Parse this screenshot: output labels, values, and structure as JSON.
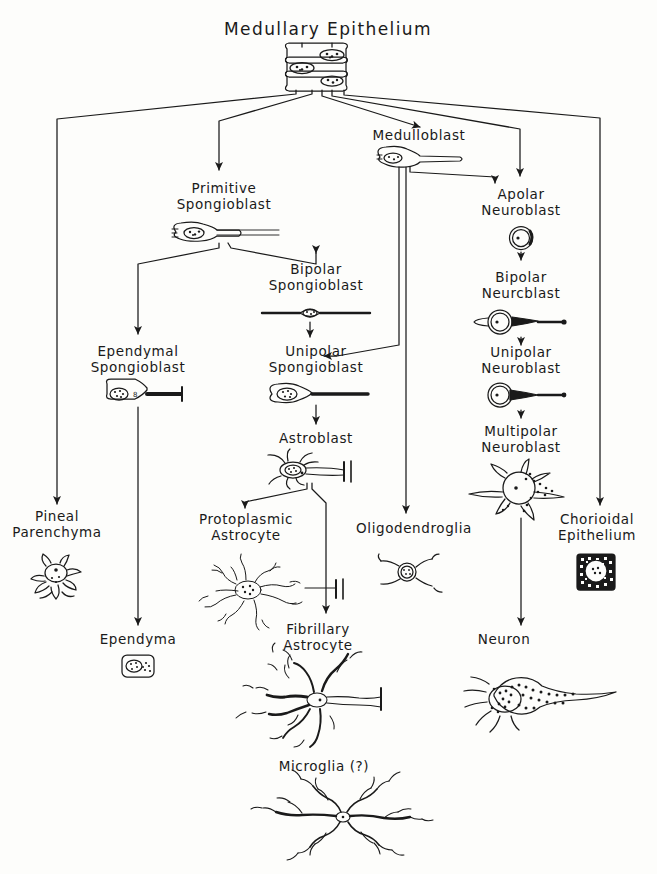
{
  "diagram": {
    "title": "Medullary Epithelium",
    "background_color": "#fdfdfb",
    "ink_color": "#1a1a1a",
    "nodes": [
      {
        "id": "medullary-epithelium",
        "label": "Medullary Epithelium",
        "x": 328,
        "y": 30,
        "cell": "epithelial-stack",
        "cell_x": 318,
        "cell_y": 48,
        "title": true
      },
      {
        "id": "primitive-spongioblast",
        "label": "Primitive\nSpongioblast",
        "x": 224,
        "y": 190,
        "cell": "pear-with-fiber",
        "cell_x": 196,
        "cell_y": 228
      },
      {
        "id": "medulloblast",
        "label": "Medulloblast",
        "x": 419,
        "y": 137,
        "cell": "pear-with-fiber",
        "cell_x": 382,
        "cell_y": 152
      },
      {
        "id": "apolar-neuroblast",
        "label": "Apolar\nNeuroblast",
        "x": 521,
        "y": 196,
        "cell": "round-cell",
        "cell_x": 512,
        "cell_y": 229
      },
      {
        "id": "bipolar-spongioblast",
        "label": "Bipolar\nSpongioblast",
        "x": 316,
        "y": 271,
        "cell": "spindle-bipolar",
        "cell_x": 272,
        "cell_y": 310
      },
      {
        "id": "bipolar-neuroblast",
        "label": "Bipolar\nNeurcblast",
        "x": 521,
        "y": 279,
        "cell": "round-bipolar",
        "cell_x": 472,
        "cell_y": 313
      },
      {
        "id": "ependymal-spongioblast",
        "label": "Ependymal\nSpongioblast",
        "x": 138,
        "y": 353,
        "cell": "ependymal-cell",
        "cell_x": 108,
        "cell_y": 387
      },
      {
        "id": "unipolar-spongioblast",
        "label": "Unipolar\nSpongioblast",
        "x": 316,
        "y": 353,
        "cell": "pear-with-fiber",
        "cell_x": 272,
        "cell_y": 388
      },
      {
        "id": "unipolar-neuroblast",
        "label": "Unipolar\nNeuroblast",
        "x": 521,
        "y": 354,
        "cell": "round-unipolar",
        "cell_x": 488,
        "cell_y": 388
      },
      {
        "id": "astroblast",
        "label": "Astroblast",
        "x": 316,
        "y": 440,
        "cell": "astroblast-cell",
        "cell_x": 262,
        "cell_y": 452
      },
      {
        "id": "multipolar-neuroblast",
        "label": "Multipolar\nNeuroblast",
        "x": 521,
        "y": 433,
        "cell": "multipolar-cell",
        "cell_x": 460,
        "cell_y": 462
      },
      {
        "id": "pineal-parenchyma",
        "label": "Pineal\nParenchyma",
        "x": 57,
        "y": 518,
        "cell": "pineal-cell",
        "cell_x": 28,
        "cell_y": 553
      },
      {
        "id": "protoplasmic-astrocyte",
        "label": "Protoplasmic\nAstrocyte",
        "x": 246,
        "y": 521,
        "cell": "protoplasmic-cell",
        "cell_x": 186,
        "cell_y": 553
      },
      {
        "id": "oligodendroglia",
        "label": "Oligodendroglia",
        "x": 414,
        "y": 530,
        "cell": "oligo-cell",
        "cell_x": 378,
        "cell_y": 548
      },
      {
        "id": "chorioidal-epithelium",
        "label": "Chorioidal\nEpithelium",
        "x": 597,
        "y": 521,
        "cell": "chorioidal-cell",
        "cell_x": 573,
        "cell_y": 553
      },
      {
        "id": "ependyma",
        "label": "Ependyma",
        "x": 138,
        "y": 641,
        "cell": "ependyma-cell",
        "cell_x": 120,
        "cell_y": 653
      },
      {
        "id": "fibrillary-astrocyte",
        "label": "Fibrillary\nAstrocyte",
        "x": 318,
        "y": 631,
        "cell": "fibrillary-cell",
        "cell_x": 232,
        "cell_y": 663
      },
      {
        "id": "neuron",
        "label": "Neuron",
        "x": 504,
        "y": 641,
        "cell": "neuron-cell",
        "cell_x": 448,
        "cell_y": 658
      },
      {
        "id": "microglia",
        "label": "Microglia (?)",
        "x": 324,
        "y": 768,
        "cell": "microglia-cell",
        "cell_x": 246,
        "cell_y": 788
      }
    ],
    "edges": [
      {
        "id": "hub-to-pineal",
        "from": "medullary-epithelium",
        "to": "pineal-parenchyma"
      },
      {
        "id": "hub-to-primitive-spongioblast",
        "from": "medullary-epithelium",
        "to": "primitive-spongioblast"
      },
      {
        "id": "hub-to-medulloblast",
        "from": "medullary-epithelium",
        "to": "medulloblast"
      },
      {
        "id": "hub-to-apolar-neuroblast",
        "from": "medullary-epithelium",
        "to": "apolar-neuroblast"
      },
      {
        "id": "hub-to-chorioidal",
        "from": "medullary-epithelium",
        "to": "chorioidal-epithelium"
      },
      {
        "id": "primitive-to-ependymal",
        "from": "primitive-spongioblast",
        "to": "ependymal-spongioblast"
      },
      {
        "id": "primitive-to-bipolar",
        "from": "primitive-spongioblast",
        "to": "bipolar-spongioblast"
      },
      {
        "id": "bipolar-to-unipolar-spongio",
        "from": "bipolar-spongioblast",
        "to": "unipolar-spongioblast"
      },
      {
        "id": "medulloblast-to-unipolar-spongio",
        "from": "medulloblast",
        "to": "unipolar-spongioblast"
      },
      {
        "id": "medulloblast-to-apolar",
        "from": "medulloblast",
        "to": "apolar-neuroblast"
      },
      {
        "id": "medulloblast-to-oligodendroglia",
        "from": "medulloblast",
        "to": "oligodendroglia"
      },
      {
        "id": "unipolar-spongio-to-astroblast",
        "from": "unipolar-spongioblast",
        "to": "astroblast"
      },
      {
        "id": "astroblast-to-protoplasmic",
        "from": "astroblast",
        "to": "protoplasmic-astrocyte"
      },
      {
        "id": "astroblast-to-fibrillary",
        "from": "astroblast",
        "to": "fibrillary-astrocyte"
      },
      {
        "id": "ependymal-to-ependyma",
        "from": "ependymal-spongioblast",
        "to": "ependyma"
      },
      {
        "id": "apolar-to-bipolar-neuroblast",
        "from": "apolar-neuroblast",
        "to": "bipolar-neuroblast"
      },
      {
        "id": "bipolar-to-unipolar-neuroblast",
        "from": "bipolar-neuroblast",
        "to": "unipolar-neuroblast"
      },
      {
        "id": "unipolar-to-multipolar-neuroblast",
        "from": "unipolar-neuroblast",
        "to": "multipolar-neuroblast"
      },
      {
        "id": "multipolar-to-neuron",
        "from": "multipolar-neuroblast",
        "to": "neuron"
      }
    ]
  }
}
